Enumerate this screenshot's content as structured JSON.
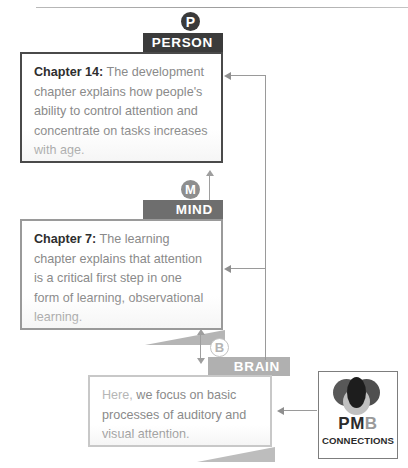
{
  "figure": {
    "levels": [
      {
        "key": "person",
        "badge": "P",
        "tab_label": "PERSON",
        "chapter_label": "Chapter 14:",
        "body_text": " The development chapter explains how people's ability to control attention and concentrate on tasks increases with age.",
        "lead_in": "",
        "tab_color": "#3b3b3b",
        "badge_color": "#3a3a3a"
      },
      {
        "key": "mind",
        "badge": "M",
        "tab_label": "MIND",
        "chapter_label": "Chapter 7:",
        "body_text": " The learning chapter explains that attention is a critical first step in one form of learning, observational learning.",
        "lead_in": "",
        "tab_color": "#6e6e6e",
        "badge_color": "#8e8e8e"
      },
      {
        "key": "brain",
        "badge": "B",
        "tab_label": "BRAIN",
        "chapter_label": "",
        "body_text": " we focus on basic processes of auditory and visual attention.",
        "lead_in": "Here,",
        "tab_color": "#b0b0b0",
        "badge_color": "#ffffff"
      }
    ],
    "logo": {
      "word_pm": "PM",
      "word_b": "B",
      "subtitle": "CONNECTIONS",
      "accent_color": "#9a9a9a",
      "text_color": "#2b2b2b"
    },
    "connectors": {
      "line_color": "#9a9a9a",
      "description_top": "arrow into PERSON box",
      "description_mid": "arrow into MIND box",
      "description_bottom": "arrow from logo into BRAIN box",
      "bidirectional_person_mind": "double-headed arrow between PERSON and MIND",
      "bidirectional_mind_brain": "double-headed arrow between MIND and BRAIN"
    }
  }
}
